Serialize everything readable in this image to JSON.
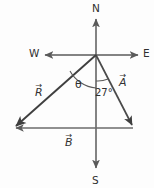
{
  "diagram": {
    "background_color": "#fdfdfd",
    "line_color": "#4a4a4a",
    "compass": {
      "north_label": "N",
      "south_label": "S",
      "east_label": "E",
      "west_label": "W"
    },
    "vectors": [
      {
        "id": "A",
        "label": "A",
        "arrow_accent": "→",
        "description": "vector A from origin to south-east, 27 degrees east of south"
      },
      {
        "id": "B",
        "label": "B",
        "arrow_accent": "→",
        "description": "vector B pointing due west along the bottom"
      },
      {
        "id": "R",
        "label": "R",
        "arrow_accent": "→",
        "description": "resultant vector R from origin to south-west"
      }
    ],
    "angles": [
      {
        "id": "theta",
        "label": "θ",
        "description": "angle between south axis and resultant R"
      },
      {
        "id": "twenty-seven",
        "label": "27°",
        "value": 27,
        "unit": "degrees",
        "description": "angle between south axis and vector A"
      }
    ]
  }
}
